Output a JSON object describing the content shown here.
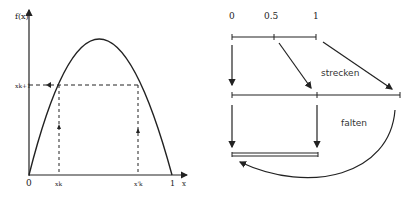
{
  "left_plot": {
    "y_axis_label": "f(x)",
    "x_axis_label": "x",
    "y_tick_label": "x_{k+1}",
    "y_tick_text": "xk+1",
    "x_tick_origin": "0",
    "x_tick_1": "xk",
    "x_tick_2": "x'k",
    "x_tick_end": "1",
    "curve": "parabola f(x) from (0,0) peaking near x=0.48, returning to (1,0)"
  },
  "right_diagram": {
    "top_labels": [
      "0",
      "0.5",
      "1"
    ],
    "stretch_label": "strecken",
    "fold_label": "falten"
  },
  "colors": {
    "ink": "#222222",
    "background": "#ffffff"
  }
}
